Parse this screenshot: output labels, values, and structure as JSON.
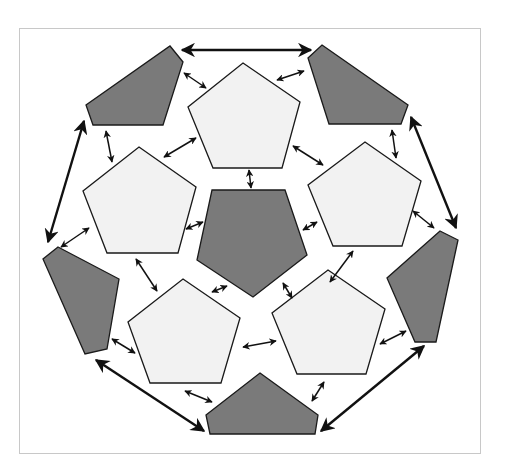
{
  "diagram": {
    "title": "",
    "colors": {
      "light_panel": "#f2f2f2",
      "dark_panel": "#7a7a7a",
      "outline": "#1a1a1a",
      "arrow": "#111111",
      "frame_border": "#c8c8c8"
    },
    "light_pentagons": [
      {
        "id": "top",
        "points": "243,63 300,102 282,168 213,168 188,107"
      },
      {
        "id": "left",
        "points": "139,147 196,187 178,253 107,253 83,191"
      },
      {
        "id": "right",
        "points": "365,142 421,181 402,246 333,246 308,185"
      },
      {
        "id": "bottom-left",
        "points": "183,279 240,318 221,383 150,383 128,322"
      },
      {
        "id": "bottom-right",
        "points": "328,270 385,309 366,374 297,374 272,313"
      }
    ],
    "dark_shapes": [
      {
        "id": "center",
        "points": "212,190 285,190 307,255 253,297 197,260"
      },
      {
        "id": "top-left",
        "points": "170,46 183,62 163,125 93,125 86,105"
      },
      {
        "id": "top-right",
        "points": "322,45 408,105 401,124 329,124 308,58"
      },
      {
        "id": "left",
        "points": "58,247 119,279 107,349 85,354 43,259"
      },
      {
        "id": "right",
        "points": "440,231 458,240 436,342 415,342 387,278"
      },
      {
        "id": "bottom",
        "points": "260,373 318,415 315,434 210,434 206,415"
      }
    ],
    "big_arrows": [
      {
        "id": "top",
        "x1": 182,
        "y1": 50,
        "x2": 311,
        "y2": 50
      },
      {
        "id": "left",
        "x1": 84,
        "y1": 121,
        "x2": 48,
        "y2": 242
      },
      {
        "id": "right",
        "x1": 411,
        "y1": 117,
        "x2": 456,
        "y2": 228
      },
      {
        "id": "bottom-left",
        "x1": 96,
        "y1": 360,
        "x2": 204,
        "y2": 431
      },
      {
        "id": "bottom-right",
        "x1": 321,
        "y1": 431,
        "x2": 424,
        "y2": 346
      }
    ],
    "small_arrows": [
      {
        "x1": 184,
        "y1": 73,
        "x2": 206,
        "y2": 88
      },
      {
        "x1": 277,
        "y1": 80,
        "x2": 304,
        "y2": 71
      },
      {
        "x1": 106,
        "y1": 131,
        "x2": 112,
        "y2": 162
      },
      {
        "x1": 164,
        "y1": 157,
        "x2": 196,
        "y2": 138
      },
      {
        "x1": 293,
        "y1": 146,
        "x2": 323,
        "y2": 165
      },
      {
        "x1": 392,
        "y1": 130,
        "x2": 396,
        "y2": 158
      },
      {
        "x1": 249,
        "y1": 170,
        "x2": 251,
        "y2": 188
      },
      {
        "x1": 186,
        "y1": 229,
        "x2": 203,
        "y2": 222
      },
      {
        "x1": 303,
        "y1": 230,
        "x2": 317,
        "y2": 222
      },
      {
        "x1": 61,
        "y1": 247,
        "x2": 89,
        "y2": 228
      },
      {
        "x1": 413,
        "y1": 211,
        "x2": 434,
        "y2": 228
      },
      {
        "x1": 136,
        "y1": 259,
        "x2": 157,
        "y2": 291
      },
      {
        "x1": 353,
        "y1": 251,
        "x2": 330,
        "y2": 282
      },
      {
        "x1": 212,
        "y1": 292,
        "x2": 227,
        "y2": 286
      },
      {
        "x1": 283,
        "y1": 283,
        "x2": 292,
        "y2": 298
      },
      {
        "x1": 112,
        "y1": 339,
        "x2": 135,
        "y2": 353
      },
      {
        "x1": 243,
        "y1": 347,
        "x2": 276,
        "y2": 341
      },
      {
        "x1": 380,
        "y1": 344,
        "x2": 406,
        "y2": 331
      },
      {
        "x1": 185,
        "y1": 391,
        "x2": 212,
        "y2": 402
      },
      {
        "x1": 324,
        "y1": 382,
        "x2": 312,
        "y2": 401
      }
    ]
  }
}
